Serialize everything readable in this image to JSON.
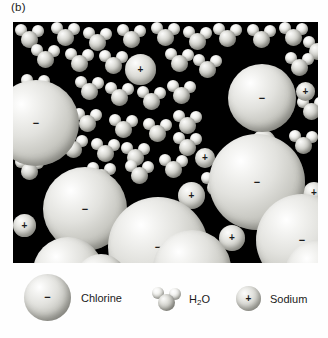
{
  "figure": {
    "panel_label": "(b)",
    "panel_background_color": "#000000",
    "page_background_color": "#ffffff"
  },
  "legend": {
    "items": [
      {
        "name": "chlorine",
        "label": "Chlorine",
        "sign": "−",
        "color": "#d8d8d3"
      },
      {
        "name": "water",
        "label_prefix": "H",
        "label_sub": "2",
        "label_suffix": "O",
        "color": "#cdcdc7"
      },
      {
        "name": "sodium",
        "label": "Sodium",
        "sign": "+",
        "color": "#dcdcd7"
      }
    ]
  },
  "particles": {
    "chlorine_sign": "−",
    "sodium_sign": "+",
    "chlorine": [
      {
        "x": -20,
        "y": 58,
        "d": 86
      },
      {
        "x": 215,
        "y": 42,
        "d": 68
      },
      {
        "x": 30,
        "y": 145,
        "d": 84
      },
      {
        "x": 137,
        "y": 26,
        "d": 0
      },
      {
        "x": 196,
        "y": 112,
        "d": 96
      },
      {
        "x": 95,
        "y": 175,
        "d": 100
      },
      {
        "x": 243,
        "y": 172,
        "d": 92
      },
      {
        "x": 20,
        "y": 215,
        "d": 70
      },
      {
        "x": 140,
        "y": 208,
        "d": 78
      },
      {
        "x": 272,
        "y": 218,
        "d": 66
      },
      {
        "x": 62,
        "y": 232,
        "d": 52
      }
    ],
    "sodium": [
      {
        "x": 112,
        "y": 32,
        "d": 31
      },
      {
        "x": 238,
        "y": 108,
        "d": 25
      },
      {
        "x": 52,
        "y": 150,
        "d": 22
      },
      {
        "x": 165,
        "y": 160,
        "d": 27
      },
      {
        "x": 0,
        "y": 192,
        "d": 23
      },
      {
        "x": 206,
        "y": 203,
        "d": 26
      },
      {
        "x": 64,
        "y": 196,
        "d": 20
      },
      {
        "x": 290,
        "y": 160,
        "d": 22
      },
      {
        "x": 182,
        "y": 126,
        "d": 20
      },
      {
        "x": 283,
        "y": 60,
        "d": 19
      }
    ],
    "water": [
      {
        "x": 2,
        "y": 2
      },
      {
        "x": 38,
        "y": 0
      },
      {
        "x": 70,
        "y": 5
      },
      {
        "x": 104,
        "y": 2
      },
      {
        "x": 138,
        "y": 0
      },
      {
        "x": 170,
        "y": 4
      },
      {
        "x": 200,
        "y": 1
      },
      {
        "x": 234,
        "y": 2
      },
      {
        "x": 266,
        "y": 0
      },
      {
        "x": 290,
        "y": 14
      },
      {
        "x": 18,
        "y": 22
      },
      {
        "x": 52,
        "y": 26
      },
      {
        "x": 86,
        "y": 28
      },
      {
        "x": 152,
        "y": 26
      },
      {
        "x": 180,
        "y": 32
      },
      {
        "x": 272,
        "y": 30
      },
      {
        "x": 8,
        "y": 52
      },
      {
        "x": 62,
        "y": 54
      },
      {
        "x": 92,
        "y": 60
      },
      {
        "x": 124,
        "y": 64
      },
      {
        "x": 154,
        "y": 58
      },
      {
        "x": 284,
        "y": 74
      },
      {
        "x": 30,
        "y": 82
      },
      {
        "x": 60,
        "y": 86
      },
      {
        "x": 96,
        "y": 92
      },
      {
        "x": 130,
        "y": 96
      },
      {
        "x": 160,
        "y": 88
      },
      {
        "x": 12,
        "y": 106
      },
      {
        "x": 46,
        "y": 112
      },
      {
        "x": 78,
        "y": 116
      },
      {
        "x": 108,
        "y": 120
      },
      {
        "x": 160,
        "y": 110
      },
      {
        "x": 276,
        "y": 108
      },
      {
        "x": 2,
        "y": 134
      },
      {
        "x": 74,
        "y": 140
      },
      {
        "x": 112,
        "y": 138
      },
      {
        "x": 146,
        "y": 132
      },
      {
        "x": 216,
        "y": 140
      },
      {
        "x": 252,
        "y": 132
      },
      {
        "x": 188,
        "y": 150
      }
    ]
  }
}
